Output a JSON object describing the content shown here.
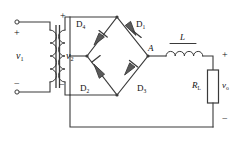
{
  "figure": {
    "kind": "circuit-schematic",
    "width": 238,
    "height": 152,
    "background_color": "#ffffff",
    "line_color": "#3a3a3a",
    "text_color": "#111111"
  },
  "sources": {
    "primary": {
      "label": "v",
      "subscript": "1",
      "plus": "+",
      "minus": "−",
      "terminal_top": "open-terminal",
      "terminal_bottom": "open-terminal"
    },
    "secondary": {
      "label": "v",
      "subscript": "2",
      "plus": "+",
      "minus": "−"
    }
  },
  "transformer": {
    "name": "transformer",
    "primary_turns": 4,
    "secondary_turns": 4,
    "core": "double-bar-iron-core"
  },
  "diodes": [
    {
      "id": "D4",
      "label": "D",
      "subscript": "4",
      "position": "bridge-top-left",
      "direction": "up-right"
    },
    {
      "id": "D1",
      "label": "D",
      "subscript": "1",
      "position": "bridge-top-right",
      "direction": "down-right"
    },
    {
      "id": "D2",
      "label": "D",
      "subscript": "2",
      "position": "bridge-bottom-left",
      "direction": "up-right"
    },
    {
      "id": "D3",
      "label": "D",
      "subscript": "3",
      "position": "bridge-bottom-right",
      "direction": "up-right"
    }
  ],
  "nodes": [
    {
      "id": "A",
      "label": "A",
      "role": "bridge-right-output-node"
    }
  ],
  "inductor": {
    "label": "L",
    "coils": 4,
    "orientation": "horizontal",
    "has_overline": true
  },
  "load": {
    "label": "R",
    "subscript": "L",
    "type": "resistor"
  },
  "output": {
    "label": "v",
    "subscript": "o",
    "plus": "+",
    "minus": "−"
  }
}
